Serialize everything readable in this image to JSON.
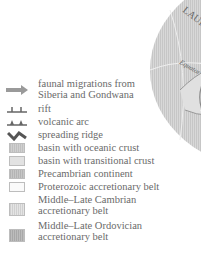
{
  "map": {
    "labels": {
      "continent": "LAURENTIA",
      "equator": "Equator"
    },
    "colors": {
      "land": "#d4d4d4",
      "stripe": "#c4c4c4",
      "outline": "#8a8a8a"
    }
  },
  "legend": {
    "items": [
      {
        "icon": "arrow-icon",
        "label": "faunal migrations from Siberia and Gondwana"
      },
      {
        "icon": "rift-icon",
        "label": "rift"
      },
      {
        "icon": "volcanic-arc-icon",
        "label": "volcanic arc"
      },
      {
        "icon": "spreading-ridge-icon",
        "label": "spreading ridge"
      },
      {
        "icon": "swatch",
        "label": "basin with oceanic crust",
        "color": "#c8c8c8"
      },
      {
        "icon": "swatch",
        "label": "basin with transitional crust",
        "color": "#e2e2e2"
      },
      {
        "icon": "swatch",
        "label": "Precambrian continent",
        "color": "#bdbdbd"
      },
      {
        "icon": "swatch",
        "label": "Proterozoic accretionary belt",
        "color": "#fafafa"
      },
      {
        "icon": "swatch",
        "label": "Middle–Late Cambrian accretionary belt",
        "line1": "Middle–Late Cambrian",
        "line2": "accretionary belt",
        "color": "#d9d9d9"
      },
      {
        "icon": "swatch",
        "label": "Middle–Late Ordovician accretionary belt",
        "line1": "Middle–Late Ordovician",
        "line2": "accretionary belt",
        "color": "#b4b4b4"
      }
    ]
  }
}
